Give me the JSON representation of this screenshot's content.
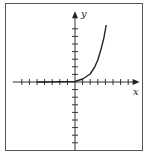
{
  "chart_data": {
    "type": "line",
    "title": "",
    "xlabel": "x",
    "ylabel": "y",
    "grid": false,
    "legend": null,
    "axes": {
      "origin_px": [
        75,
        82
      ],
      "unit_px": 7.6,
      "x_ticks": [
        -7,
        -6,
        -5,
        -4,
        -3,
        -2,
        -1,
        1,
        2,
        3,
        4,
        5,
        6,
        7
      ],
      "y_ticks": [
        -8,
        -7,
        -6,
        -5,
        -4,
        -3,
        -2,
        -1,
        1,
        2,
        3,
        4,
        5,
        6,
        7
      ],
      "xlim": [
        -8.2,
        8.5
      ],
      "ylim": [
        -9,
        9.3
      ],
      "tick_labels_shown": false
    },
    "series": [
      {
        "name": "curve",
        "description": "exponential growth curve, near zero for x<0, rising steeply for x>0",
        "x": [
          -5,
          -4,
          -3,
          -2,
          -1,
          0,
          1,
          2,
          2.6,
          3,
          3.4,
          3.8,
          4.1
        ],
        "y": [
          0.0,
          0.0,
          0.01,
          0.02,
          0.05,
          0.07,
          0.4,
          1.05,
          2.0,
          2.9,
          4.2,
          5.8,
          7.5
        ]
      }
    ],
    "colors": {
      "axis": "#333333",
      "curve": "#222222",
      "frame": "#555555"
    }
  },
  "labels": {
    "x_axis": "x",
    "y_axis": "y"
  }
}
